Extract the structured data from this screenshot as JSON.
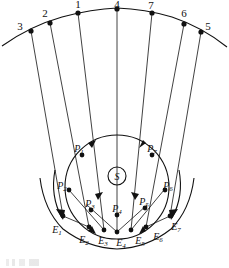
{
  "figure": {
    "background_color": "#ffffff",
    "ink_color": "#111111"
  },
  "center": {
    "label": "S",
    "name": "central-body"
  },
  "outer_points": [
    {
      "id": "3",
      "label": "3"
    },
    {
      "id": "2",
      "label": "2"
    },
    {
      "id": "1",
      "label": "1"
    },
    {
      "id": "4",
      "label": "4"
    },
    {
      "id": "7",
      "label": "7"
    },
    {
      "id": "6",
      "label": "6"
    },
    {
      "id": "5",
      "label": "5"
    }
  ],
  "inner_points": [
    {
      "id": "P1",
      "base": "P",
      "sub": "1"
    },
    {
      "id": "P2",
      "base": "P",
      "sub": "2"
    },
    {
      "id": "P3",
      "base": "P",
      "sub": "3"
    },
    {
      "id": "P4",
      "base": "P",
      "sub": "4"
    },
    {
      "id": "P5",
      "base": "P",
      "sub": "5"
    },
    {
      "id": "P6",
      "base": "P",
      "sub": "6"
    },
    {
      "id": "P7",
      "base": "P",
      "sub": "7"
    }
  ],
  "lower_points": [
    {
      "id": "E1",
      "base": "E",
      "sub": "1"
    },
    {
      "id": "E2",
      "base": "E",
      "sub": "2"
    },
    {
      "id": "E3",
      "base": "E",
      "sub": "3"
    },
    {
      "id": "E4",
      "base": "E",
      "sub": "4"
    },
    {
      "id": "E5",
      "base": "E",
      "sub": "5"
    },
    {
      "id": "E6",
      "base": "E",
      "sub": "6"
    },
    {
      "id": "E7",
      "base": "E",
      "sub": "7"
    }
  ]
}
